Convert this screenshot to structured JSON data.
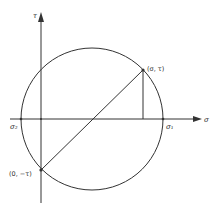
{
  "diagram": {
    "type": "mohr-circle",
    "axes": {
      "horizontal_label": "σ",
      "vertical_label": "τ"
    },
    "points": {
      "top_right": {
        "label": "(σ, τ)"
      },
      "bottom_left": {
        "label": "(0, −τ)"
      },
      "sigma2": {
        "label": "σ₂"
      },
      "sigma1": {
        "label": "σ₁"
      }
    },
    "colors": {
      "stroke": "#333333",
      "background": "#ffffff"
    }
  }
}
